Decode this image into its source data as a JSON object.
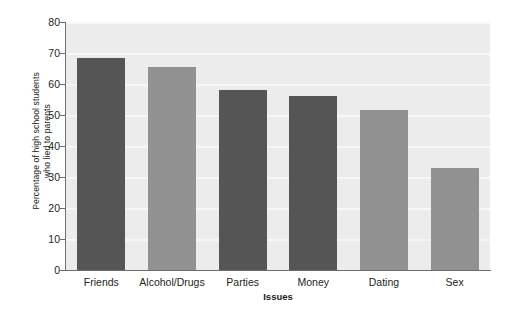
{
  "chart_data": {
    "type": "bar",
    "title": "",
    "subtitle": "",
    "xlabel": "Issues",
    "ylabel": "Percentage of high school students who lied to parents",
    "ylabel_lines": [
      "Percentage of high school students",
      "who lied to parents"
    ],
    "categories": [
      "Friends",
      "Alcohol/Drugs",
      "Parties",
      "Money",
      "Dating",
      "Sex"
    ],
    "values": [
      68.5,
      65.5,
      58,
      56,
      51.5,
      33
    ],
    "ylim": [
      0,
      80
    ],
    "yticks": [
      0,
      10,
      20,
      30,
      40,
      50,
      60,
      70,
      80
    ],
    "ytick_labels": [
      "0",
      "10",
      "20",
      "30",
      "40",
      "50",
      "60",
      "70",
      "80"
    ],
    "grid": true,
    "legend": "none",
    "bar_colors": [
      "#555555",
      "#919191",
      "#555555",
      "#555555",
      "#919191",
      "#919191"
    ],
    "plot_background": "#ececec",
    "gridline_color": "#f7f7f7",
    "axis_color": "#6d6e71",
    "text_color": "#231f20"
  }
}
